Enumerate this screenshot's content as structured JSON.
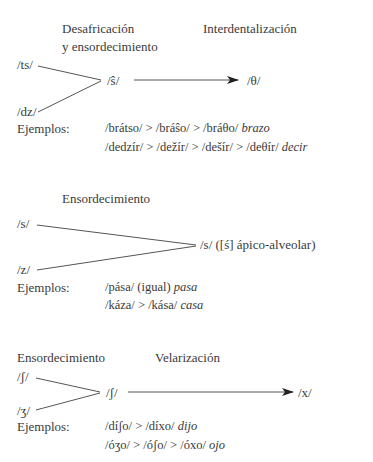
{
  "diagram1": {
    "header_left_line1": "Desafricación",
    "header_left_line2": "y ensordecimiento",
    "header_right": "Interdentalización",
    "input_top": "/ts/",
    "input_bottom": "/dz/",
    "merged": "/ŝ/",
    "output": "/θ/",
    "examples_label": "Ejemplos:",
    "examples": [
      {
        "chain": "/brátso/ > /bráŝo/ > /bráθo/",
        "gloss": "brazo"
      },
      {
        "chain": "/dedzír/ > /dežír/ > /dešír/ > /deθír/",
        "gloss": "decir"
      }
    ]
  },
  "diagram2": {
    "header": "Ensordecimiento",
    "input_top": "/s/",
    "input_bottom": "/z/",
    "output": "/s/ ([ś] ápico-alveolar)",
    "examples_label": "Ejemplos:",
    "examples": [
      {
        "chain": "/pása/ (igual)",
        "gloss": "pasa"
      },
      {
        "chain": "/káza/ > /kása/",
        "gloss": "casa"
      }
    ]
  },
  "diagram3": {
    "header_left": "Ensordecimiento",
    "header_right": "Velarización",
    "input_top": "/ʃ/",
    "input_bottom": "/ʒ/",
    "merged": "/ʃ/",
    "output": "/x/",
    "examples_label": "Ejemplos:",
    "examples": [
      {
        "chain": "/díʃo/ > /díxo/",
        "gloss": "dijo"
      },
      {
        "chain": "/óʒo/ > /óʃo/ > /óxo/",
        "gloss": "ojo"
      }
    ]
  }
}
